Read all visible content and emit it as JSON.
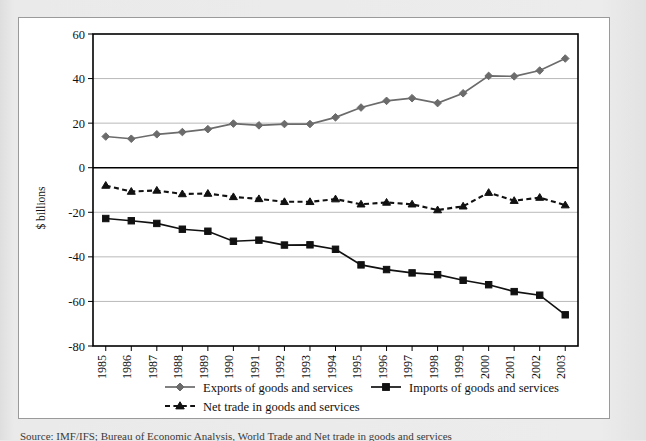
{
  "figure": {
    "ylabel": "$ billions",
    "caption": "Source: IMF/IFS; Bureau of Economic Analysis, World Trade and Net trade in goods and services"
  },
  "chart_data": {
    "type": "line",
    "title": "",
    "xlabel": "",
    "ylabel": "$ billions",
    "ylim": [
      -80,
      60
    ],
    "yticks": [
      60,
      40,
      20,
      0,
      -20,
      -40,
      -60,
      -80
    ],
    "ytick_labels": [
      "60",
      "40",
      "20",
      "0",
      "-20",
      "-40",
      "-60",
      "-80"
    ],
    "grid": "horizontal",
    "legend_position": "bottom",
    "categories": [
      "1985",
      "1986",
      "1987",
      "1988",
      "1989",
      "1990",
      "1991",
      "1992",
      "1993",
      "1994",
      "1995",
      "1996",
      "1997",
      "1998",
      "1999",
      "2000",
      "2001",
      "2002",
      "2003"
    ],
    "series": [
      {
        "name": "Exports of goods and services",
        "marker": "diamond",
        "line": "solid",
        "color": "#6b6b6b",
        "values": [
          14,
          13,
          15,
          16,
          17.3,
          19.8,
          19,
          19.6,
          19.6,
          22.6,
          27,
          30,
          31.2,
          29,
          33.4,
          41.2,
          41,
          43.6,
          49
        ]
      },
      {
        "name": "Imports of goods and services",
        "marker": "square",
        "line": "solid",
        "color": "#111111",
        "values": [
          -22.8,
          -23.8,
          -25,
          -27.6,
          -28.5,
          -33,
          -32.5,
          -34.7,
          -34.6,
          -36.6,
          -43.6,
          -45.7,
          -47.2,
          -48,
          -50.5,
          -52.5,
          -55.6,
          -57.2,
          -66
        ]
      },
      {
        "name": "Net trade in goods and services",
        "marker": "triangle",
        "line": "dashed",
        "color": "#111111",
        "values": [
          -8,
          -10.7,
          -10.2,
          -11.8,
          -11.6,
          -13.1,
          -14,
          -15.3,
          -15.3,
          -14.1,
          -16.4,
          -15.6,
          -16.4,
          -19,
          -17.3,
          -11.2,
          -14.8,
          -13.4,
          -16.8
        ]
      }
    ]
  },
  "legend": {
    "items": [
      {
        "label": "Exports of goods and services"
      },
      {
        "label": "Imports of goods and services"
      },
      {
        "label": "Net trade in goods and services"
      }
    ]
  }
}
